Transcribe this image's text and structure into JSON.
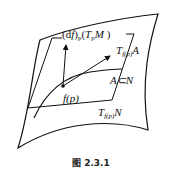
{
  "figure": {
    "caption": "图 2.3.1",
    "labels": {
      "image_plane": "(df)p(TpM)",
      "tangent_A": "Tf(p)A",
      "subset": "A⊂N",
      "point": "f(p)",
      "tangent_N": "Tf(p)N"
    }
  }
}
